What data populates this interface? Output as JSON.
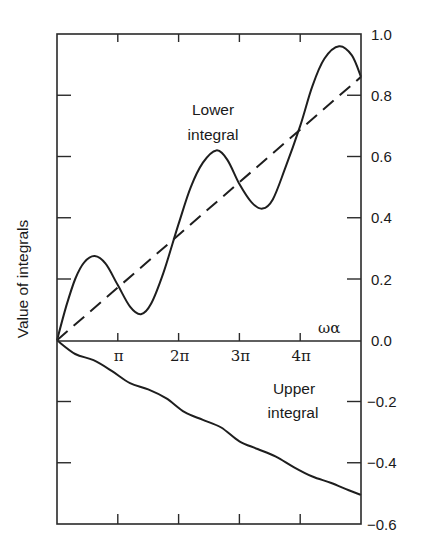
{
  "chart_data": {
    "type": "line",
    "title": "",
    "xlabel": "ωα",
    "ylabel": "Value of integrals",
    "xlim_pi": [
      0,
      5
    ],
    "ylim": [
      -0.6,
      1.0
    ],
    "grid": false,
    "legend": "none (inline annotations)",
    "x_ticks": [
      {
        "value_pi": 1,
        "label": "π"
      },
      {
        "value_pi": 2,
        "label": "2π"
      },
      {
        "value_pi": 3,
        "label": "3π"
      },
      {
        "value_pi": 4,
        "label": "4π"
      }
    ],
    "y_ticks": [
      {
        "value": 1.0,
        "label": "1.0"
      },
      {
        "value": 0.8,
        "label": "0.8"
      },
      {
        "value": 0.6,
        "label": "0.6"
      },
      {
        "value": 0.4,
        "label": "0.4"
      },
      {
        "value": 0.2,
        "label": "0.2"
      },
      {
        "value": 0.0,
        "label": "0.0"
      },
      {
        "value": -0.2,
        "label": "−0.2"
      },
      {
        "value": -0.4,
        "label": "−0.4"
      },
      {
        "value": -0.6,
        "label": "−0.6"
      }
    ],
    "annotations": [
      {
        "text_lines": [
          "Lower",
          "integral"
        ],
        "x_pi": 2.25,
        "y": 0.78
      },
      {
        "text_lines": [
          "Upper",
          "integral"
        ],
        "x_pi": 3.95,
        "y": -0.25
      }
    ],
    "series": [
      {
        "name": "Lower integral",
        "style": "solid",
        "x_pi": [
          0,
          0.15,
          0.3,
          0.45,
          0.62,
          0.8,
          1.0,
          1.2,
          1.38,
          1.55,
          1.75,
          2.0,
          2.2,
          2.4,
          2.62,
          2.8,
          3.0,
          3.2,
          3.38,
          3.55,
          3.75,
          4.0,
          4.2,
          4.4,
          4.64,
          4.85,
          5.0
        ],
        "values": [
          0.0,
          0.11,
          0.2,
          0.255,
          0.275,
          0.25,
          0.18,
          0.11,
          0.085,
          0.12,
          0.22,
          0.38,
          0.5,
          0.58,
          0.62,
          0.59,
          0.51,
          0.45,
          0.43,
          0.46,
          0.56,
          0.7,
          0.83,
          0.92,
          0.96,
          0.93,
          0.86
        ]
      },
      {
        "name": "Mean (dashed)",
        "style": "dashed",
        "x_pi": [
          0,
          5.0
        ],
        "values": [
          0.0,
          0.86
        ]
      },
      {
        "name": "Upper integral",
        "style": "solid",
        "x_pi": [
          0,
          0.3,
          0.6,
          0.9,
          1.2,
          1.5,
          1.8,
          2.1,
          2.4,
          2.7,
          3.0,
          3.3,
          3.6,
          3.9,
          4.2,
          4.5,
          4.8,
          5.0
        ],
        "values": [
          0.0,
          -0.045,
          -0.065,
          -0.1,
          -0.14,
          -0.16,
          -0.19,
          -0.235,
          -0.26,
          -0.285,
          -0.33,
          -0.355,
          -0.38,
          -0.415,
          -0.445,
          -0.465,
          -0.49,
          -0.505
        ]
      }
    ]
  },
  "labels": {
    "y_axis_title": "Value of integrals",
    "x_axis_symbol": "ωα",
    "lower_annotation": [
      "Lower",
      "integral"
    ],
    "upper_annotation": [
      "Upper",
      "integral"
    ]
  }
}
